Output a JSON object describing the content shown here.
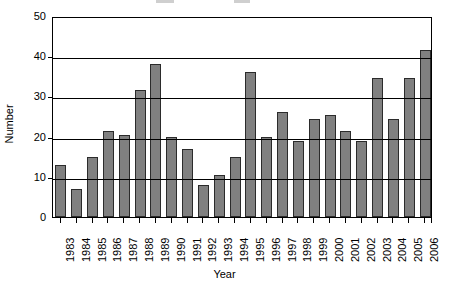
{
  "chart_data": {
    "type": "bar",
    "title": "",
    "xlabel": "Year",
    "ylabel": "Number",
    "ylim": [
      0,
      50
    ],
    "yticks": [
      0,
      10,
      20,
      30,
      40,
      50
    ],
    "grid": true,
    "legend": "none",
    "bar_color": "#808080",
    "bar_edge_color": "#2b2b2b",
    "categories": [
      "1983",
      "1984",
      "1985",
      "1986",
      "1987",
      "1988",
      "1989",
      "1990",
      "1991",
      "1992",
      "1993",
      "1994",
      "1995",
      "1996",
      "1997",
      "1998",
      "1999",
      "2000",
      "2001",
      "2002",
      "2003",
      "2004",
      "2005",
      "2006"
    ],
    "values": [
      13,
      7,
      15,
      21.5,
      20.5,
      31.5,
      38,
      20,
      17,
      8,
      10.5,
      15,
      36,
      20,
      26,
      19,
      24.5,
      25.5,
      21.5,
      19,
      34.5,
      24.5,
      34.5,
      41.5
    ]
  }
}
